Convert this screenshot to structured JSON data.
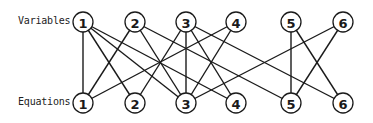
{
  "labels": {
    "variables": "Variables",
    "equations": "Equations"
  },
  "style": {
    "line_color": "#1a1a1a",
    "background": "#ffffff"
  },
  "variables": [
    {
      "id": "V1",
      "label": "1",
      "x": 83,
      "y": 22
    },
    {
      "id": "V2",
      "label": "2",
      "x": 135,
      "y": 22
    },
    {
      "id": "V3",
      "label": "3",
      "x": 186,
      "y": 22
    },
    {
      "id": "V4",
      "label": "4",
      "x": 236,
      "y": 22
    },
    {
      "id": "V5",
      "label": "5",
      "x": 291,
      "y": 22
    },
    {
      "id": "V6",
      "label": "6",
      "x": 343,
      "y": 22
    }
  ],
  "equations": [
    {
      "id": "E1",
      "label": "1",
      "x": 83,
      "y": 103
    },
    {
      "id": "E2",
      "label": "2",
      "x": 135,
      "y": 103
    },
    {
      "id": "E3",
      "label": "3",
      "x": 186,
      "y": 103
    },
    {
      "id": "E4",
      "label": "4",
      "x": 236,
      "y": 103
    },
    {
      "id": "E5",
      "label": "5",
      "x": 291,
      "y": 103
    },
    {
      "id": "E6",
      "label": "6",
      "x": 343,
      "y": 103
    }
  ],
  "edges": [
    [
      "V1",
      "E1"
    ],
    [
      "V1",
      "E2"
    ],
    [
      "V1",
      "E3"
    ],
    [
      "V1",
      "E4"
    ],
    [
      "V2",
      "E1"
    ],
    [
      "V2",
      "E3"
    ],
    [
      "V2",
      "E5"
    ],
    [
      "V3",
      "E2"
    ],
    [
      "V3",
      "E3"
    ],
    [
      "V3",
      "E4"
    ],
    [
      "V3",
      "E6"
    ],
    [
      "V4",
      "E1"
    ],
    [
      "V4",
      "E3"
    ],
    [
      "V5",
      "E5"
    ],
    [
      "V5",
      "E6"
    ],
    [
      "V6",
      "E3"
    ],
    [
      "V6",
      "E5"
    ]
  ]
}
